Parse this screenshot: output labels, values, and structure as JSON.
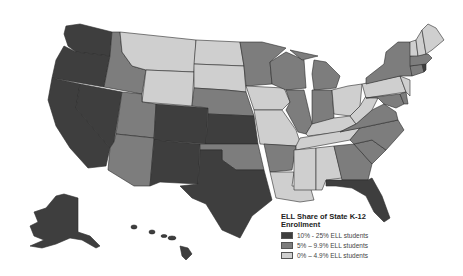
{
  "legend": {
    "title": "ELL Share of State K-12 Enrollment",
    "title_line1": "ELL Share of State K-12",
    "title_line2": "Enrollment",
    "items": [
      {
        "label": "10% - 25% ELL students",
        "color": "#3e3e3e"
      },
      {
        "label": "5% – 9.9% ELL students",
        "color": "#7d7d7d"
      },
      {
        "label": "0% – 4.9% ELL students",
        "color": "#cfcfcf"
      }
    ]
  },
  "categories": {
    "high": [
      "WA",
      "OR",
      "CA",
      "NV",
      "CO",
      "NM",
      "TX",
      "KS",
      "FL",
      "AK",
      "HI",
      "RI"
    ],
    "mid": [
      "ID",
      "UT",
      "AZ",
      "MN",
      "NE",
      "OK",
      "AR",
      "WI",
      "IL",
      "MI",
      "IN",
      "GA",
      "NC",
      "VA",
      "MD",
      "NY",
      "MA",
      "CT",
      "DE",
      "DC"
    ],
    "low": [
      "MT",
      "WY",
      "ND",
      "SD",
      "IA",
      "MO",
      "KY",
      "TN",
      "OH",
      "PA",
      "WV",
      "MS",
      "AL",
      "LA",
      "SC",
      "ME",
      "VT",
      "NH",
      "NJ"
    ]
  }
}
